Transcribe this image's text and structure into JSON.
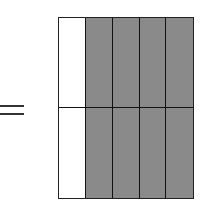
{
  "equals_sign": {
    "symbol": "=",
    "color": "#333333"
  },
  "fraction_grid": {
    "rows": 2,
    "columns": 5,
    "shaded_columns_per_row": 4,
    "total_cells": 10,
    "shaded_cells": 8,
    "fraction_shaded": "8/10",
    "colors": {
      "shaded": "#8a8a8a",
      "unshaded": "#ffffff",
      "border": "#111111"
    },
    "cells": [
      [
        "white",
        "shaded",
        "shaded",
        "shaded",
        "shaded"
      ],
      [
        "white",
        "shaded",
        "shaded",
        "shaded",
        "shaded"
      ]
    ]
  }
}
